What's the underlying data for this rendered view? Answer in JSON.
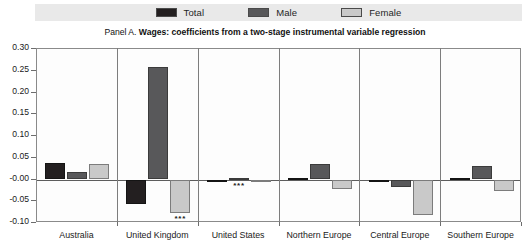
{
  "legend": {
    "items": [
      {
        "label": "Total",
        "color": "#231f20"
      },
      {
        "label": "Male",
        "color": "#58585a"
      },
      {
        "label": "Female",
        "color": "#c9c9c9"
      }
    ]
  },
  "title": {
    "prefix": "Panel A.",
    "strong": "Wages: coefficients from a two-stage instrumental variable regression"
  },
  "chart_data": {
    "type": "bar",
    "title": "Panel A. Wages: coefficients from a two-stage instrumental variable regression",
    "xlabel": "",
    "ylabel": "",
    "ylim": [
      -0.1,
      0.3
    ],
    "ytick_labels": [
      "0.30",
      "0.25",
      "0.20",
      "0.15",
      "0.10",
      "0.05",
      "-0.00",
      "-0.05",
      "-0.10"
    ],
    "ytick_values": [
      0.3,
      0.25,
      0.2,
      0.15,
      0.1,
      0.05,
      0.0,
      -0.05,
      -0.1
    ],
    "grid": false,
    "legend_position": "top",
    "categories": [
      "Australia",
      "United Kingdom",
      "United States",
      "Northern Europe",
      "Central Europe",
      "Southern Europe"
    ],
    "series": [
      {
        "name": "Total",
        "color": "#231f20",
        "values": [
          0.038,
          -0.056,
          -0.004,
          0.002,
          -0.003,
          0.002
        ]
      },
      {
        "name": "Male",
        "color": "#58585a",
        "values": [
          0.017,
          0.258,
          0.004,
          0.035,
          -0.018,
          0.03
        ]
      },
      {
        "name": "Female",
        "color": "#c9c9c9",
        "values": [
          0.035,
          -0.076,
          -0.001,
          -0.021,
          -0.082,
          -0.026
        ]
      }
    ],
    "annotations": [
      {
        "text": "***",
        "category": "United Kingdom",
        "series": "Female"
      },
      {
        "text": "***",
        "category": "United States",
        "series": "Male"
      }
    ]
  }
}
